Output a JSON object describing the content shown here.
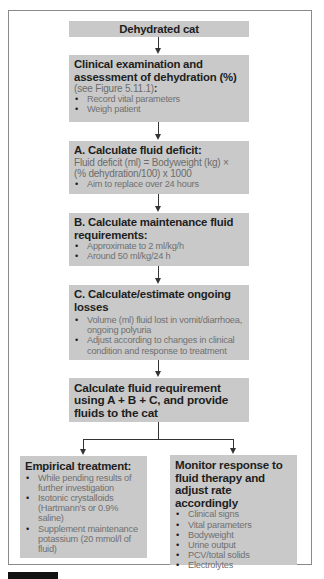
{
  "flowchart": {
    "start": {
      "title": "Dehydrated cat"
    },
    "clinical": {
      "title": "Clinical examination and assessment of dehydration (%)",
      "ref": "(see Figure 5.11.1)",
      "ref_colon": ":",
      "bullets": [
        "Record vital parameters",
        "Weigh patient"
      ]
    },
    "step_a": {
      "title": "A. Calculate fluid deficit:",
      "formula_line1": "Fluid deficit (ml) = Bodyweight (kg) ×",
      "formula_line2": "(% dehydration/100) x 1000",
      "bullets": [
        "Aim to replace over 24 hours"
      ]
    },
    "step_b": {
      "title": "B. Calculate maintenance fluid requirements:",
      "bullets": [
        "Approximate to 2 ml/kg/h",
        "Around 50 ml/kg/24 h"
      ]
    },
    "step_c": {
      "title": "C. Calculate/estimate ongoing losses",
      "bullets": [
        "Volume (ml) fluid lost in vomit/diarrhoea, ongoing polyuria",
        "Adjust according to changes in clinical condition and response to treatment"
      ]
    },
    "total": {
      "title": "Calculate fluid requirement using A + B + C, and provide fluids to the cat"
    },
    "empirical": {
      "title": "Empirical treatment:",
      "bullets": [
        "While pending results of further investigation",
        "Isotonic crystalloids (Hartmann's or 0.9% saline)",
        "Supplement maintenance potassium (20 mmol/l of fluid)"
      ]
    },
    "monitor": {
      "title": "Monitor response to fluid therapy and adjust rate accordingly",
      "bullets": [
        "Clinical signs",
        "Vital parameters",
        "Bodyweight",
        "Urine output",
        "PCV/total solids",
        "Electrolytes"
      ]
    }
  },
  "colors": {
    "box_fill": "#c9c9c9",
    "heading_text": "#1e1e1e",
    "body_text": "#6c6c6c",
    "frame": "#8a8a8a",
    "connector": "#333333"
  }
}
